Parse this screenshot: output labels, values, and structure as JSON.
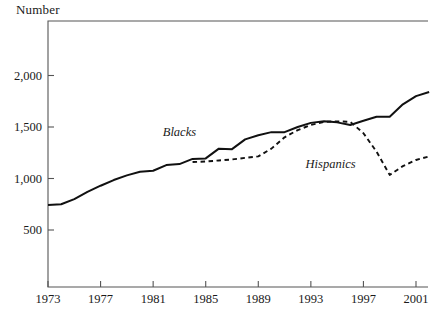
{
  "chart_data": {
    "type": "line",
    "title": "Number",
    "xlabel": "",
    "ylabel": "Number",
    "grid": false,
    "legend_position": "inline-annotation",
    "xlim": [
      1973,
      2002
    ],
    "ylim": [
      0,
      2200
    ],
    "x_ticks": [
      1973,
      1977,
      1981,
      1985,
      1989,
      1993,
      1997,
      2001
    ],
    "x_tick_labels": [
      "1973",
      "1977",
      "1981",
      "1985",
      "1989",
      "1993",
      "1997",
      "2001"
    ],
    "y_ticks": [
      500,
      1000,
      1500,
      2000
    ],
    "y_tick_labels": [
      "500",
      "1,000",
      "1,500",
      "2,000"
    ],
    "series": [
      {
        "name": "Blacks",
        "style": "solid",
        "color": "#111111",
        "label_x": 1983.0,
        "label_y": 1450,
        "x": [
          1973,
          1974,
          1975,
          1976,
          1977,
          1978,
          1979,
          1980,
          1981,
          1982,
          1983,
          1984,
          1985,
          1986,
          1987,
          1988,
          1989,
          1990,
          1991,
          1992,
          1993,
          1994,
          1995,
          1996,
          1997,
          1998,
          1999,
          2000,
          2001,
          2002
        ],
        "values": [
          743,
          750,
          800,
          870,
          930,
          985,
          1030,
          1065,
          1075,
          1130,
          1140,
          1190,
          1195,
          1290,
          1285,
          1380,
          1420,
          1450,
          1450,
          1500,
          1540,
          1555,
          1545,
          1520,
          1560,
          1600,
          1600,
          1720,
          1800,
          1840
        ]
      },
      {
        "name": "Hispanics",
        "style": "dashed",
        "color": "#111111",
        "label_x": 1994.5,
        "label_y": 1145,
        "x": [
          1984,
          1985,
          1986,
          1987,
          1988,
          1989,
          1990,
          1991,
          1992,
          1993,
          1994,
          1995,
          1996,
          1997,
          1998,
          1999,
          2000,
          2001,
          2002
        ],
        "values": [
          1160,
          1165,
          1175,
          1185,
          1200,
          1215,
          1290,
          1400,
          1470,
          1520,
          1550,
          1555,
          1550,
          1440,
          1260,
          1035,
          1120,
          1180,
          1215
        ]
      }
    ],
    "annotations": [
      {
        "text": "Blacks",
        "style": "italic"
      },
      {
        "text": "Hispanics",
        "style": "italic"
      }
    ]
  },
  "axis": {
    "frame_color": "#555555",
    "tick_color": "#555555"
  }
}
